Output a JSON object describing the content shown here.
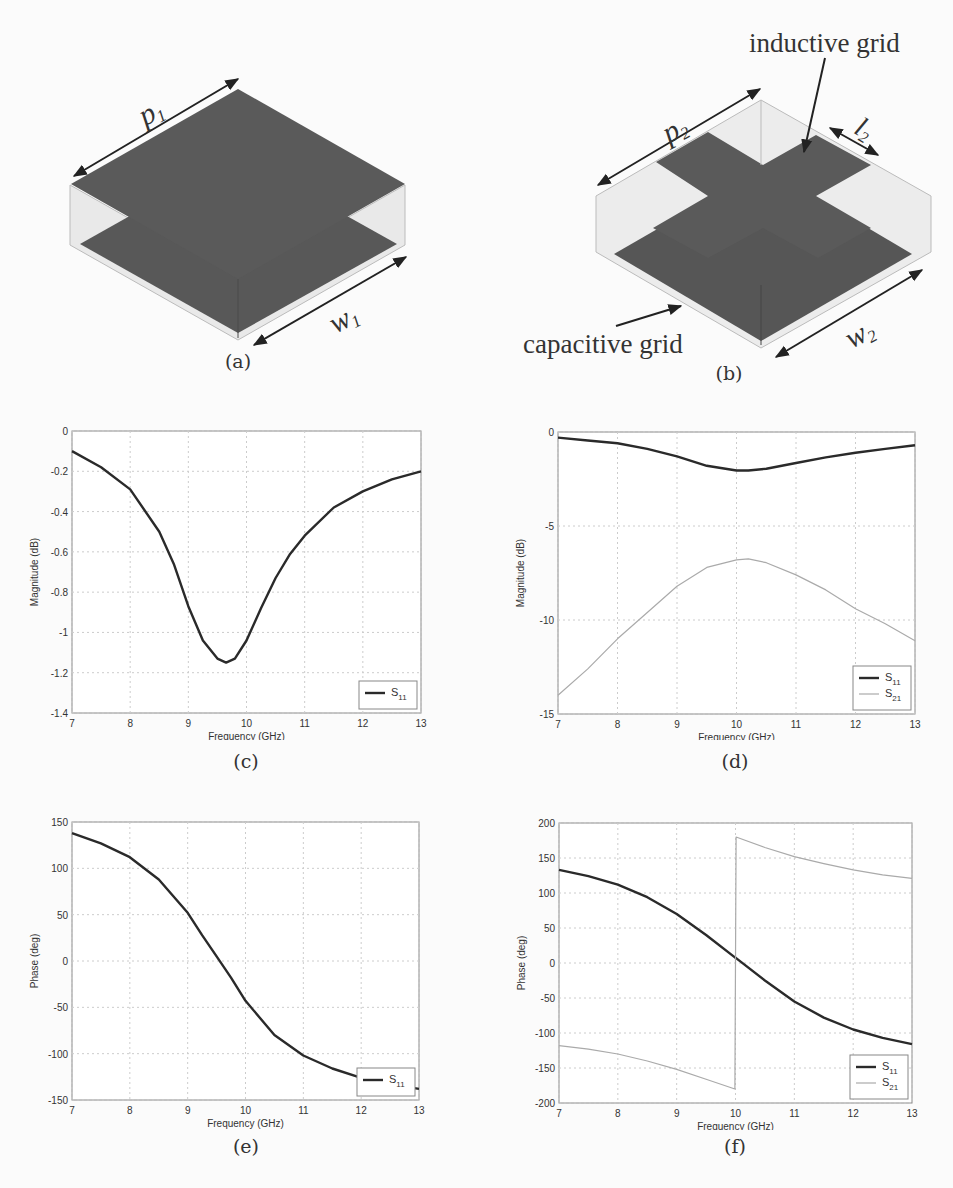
{
  "figure": {
    "panels": [
      {
        "id": "a",
        "caption": "(a)",
        "labels": {
          "p": "p",
          "p_sub": "1",
          "w": "w",
          "w_sub": "1"
        }
      },
      {
        "id": "b",
        "caption": "(b)",
        "labels": {
          "p": "p",
          "p_sub": "2",
          "w": "w",
          "w_sub": "2",
          "l": "l",
          "l_sub": "2",
          "inductive": "inductive grid",
          "capacitive": "capacitive grid"
        }
      },
      {
        "id": "c",
        "caption": "(c)"
      },
      {
        "id": "d",
        "caption": "(d)"
      },
      {
        "id": "e",
        "caption": "(e)"
      },
      {
        "id": "f",
        "caption": "(f)"
      }
    ]
  },
  "chart_data": [
    {
      "panel": "c",
      "type": "line",
      "title": "",
      "xlabel": "Frequency (GHz)",
      "ylabel": "Magnitude (dB)",
      "xlim": [
        7,
        13
      ],
      "ylim": [
        -1.4,
        0
      ],
      "xticks": [
        "7",
        "8",
        "9",
        "10",
        "11",
        "12",
        "13"
      ],
      "yticks": [
        "0",
        "-0.2",
        "-0.4",
        "-0.6",
        "-0.8",
        "-1",
        "-1.2",
        "-1.4"
      ],
      "grid": true,
      "legend_position": "lower right",
      "x": [
        7,
        7.5,
        8,
        8.5,
        8.75,
        9,
        9.25,
        9.5,
        9.65,
        9.8,
        10,
        10.25,
        10.5,
        10.75,
        11,
        11.5,
        12,
        12.5,
        13
      ],
      "series": [
        {
          "name": "S11",
          "sub": "11",
          "style": "thick-dark",
          "values": [
            -0.1,
            -0.18,
            -0.29,
            -0.5,
            -0.66,
            -0.87,
            -1.04,
            -1.13,
            -1.15,
            -1.13,
            -1.04,
            -0.88,
            -0.73,
            -0.61,
            -0.52,
            -0.38,
            -0.3,
            -0.24,
            -0.2
          ]
        }
      ]
    },
    {
      "panel": "d",
      "type": "line",
      "title": "",
      "xlabel": "Frequency (GHz)",
      "ylabel": "Magnitude (dB)",
      "xlim": [
        7,
        13
      ],
      "ylim": [
        -15,
        0
      ],
      "xticks": [
        "7",
        "8",
        "9",
        "10",
        "11",
        "12",
        "13"
      ],
      "yticks": [
        "0",
        "-5",
        "-10",
        "-15"
      ],
      "grid": true,
      "legend_position": "lower right",
      "x": [
        7,
        7.5,
        8,
        8.5,
        9,
        9.5,
        10,
        10.2,
        10.5,
        11,
        11.5,
        12,
        12.5,
        13
      ],
      "series": [
        {
          "name": "S11",
          "sub": "11",
          "style": "thick-dark",
          "values": [
            -0.3,
            -0.45,
            -0.6,
            -0.9,
            -1.3,
            -1.8,
            -2.05,
            -2.05,
            -1.95,
            -1.65,
            -1.35,
            -1.1,
            -0.9,
            -0.7
          ]
        },
        {
          "name": "S21",
          "sub": "21",
          "style": "thin-light",
          "values": [
            -14.0,
            -12.6,
            -11.0,
            -9.6,
            -8.2,
            -7.2,
            -6.8,
            -6.75,
            -6.95,
            -7.6,
            -8.4,
            -9.4,
            -10.2,
            -11.1
          ]
        }
      ]
    },
    {
      "panel": "e",
      "type": "line",
      "title": "",
      "xlabel": "Frequency (GHz)",
      "ylabel": "Phase (deg)",
      "xlim": [
        7,
        13
      ],
      "ylim": [
        -150,
        150
      ],
      "xticks": [
        "7",
        "8",
        "9",
        "10",
        "11",
        "12",
        "13"
      ],
      "yticks": [
        "150",
        "100",
        "50",
        "0",
        "-50",
        "-100",
        "-150"
      ],
      "grid": true,
      "legend_position": "lower right",
      "x": [
        7,
        7.5,
        8,
        8.5,
        9,
        9.25,
        9.5,
        9.75,
        10,
        10.5,
        11,
        11.5,
        12,
        12.5,
        13
      ],
      "series": [
        {
          "name": "S11",
          "sub": "11",
          "style": "thick-dark",
          "values": [
            138,
            127,
            112,
            88,
            52,
            28,
            5,
            -18,
            -43,
            -80,
            -102,
            -116,
            -126,
            -133,
            -138
          ]
        }
      ]
    },
    {
      "panel": "f",
      "type": "line",
      "title": "",
      "xlabel": "Frequency (GHz)",
      "ylabel": "Phase (deg)",
      "xlim": [
        7,
        13
      ],
      "ylim": [
        -200,
        200
      ],
      "xticks": [
        "7",
        "8",
        "9",
        "10",
        "11",
        "12",
        "13"
      ],
      "yticks": [
        "200",
        "150",
        "100",
        "50",
        "0",
        "-50",
        "-100",
        "-150",
        "-200"
      ],
      "grid": true,
      "legend_position": "lower right",
      "x": [
        7,
        7.5,
        8,
        8.5,
        9,
        9.5,
        9.99,
        10.01,
        10.5,
        11,
        11.5,
        12,
        12.5,
        13
      ],
      "series": [
        {
          "name": "S11",
          "sub": "11",
          "style": "thick-dark",
          "values": [
            133,
            124,
            112,
            94,
            70,
            40,
            8,
            7,
            -25,
            -55,
            -78,
            -95,
            -107,
            -116
          ]
        },
        {
          "name": "S21",
          "sub": "21",
          "style": "thin-light",
          "values": [
            -118,
            -123,
            -130,
            -140,
            -152,
            -166,
            -180,
            180,
            165,
            152,
            142,
            133,
            126,
            121
          ]
        }
      ]
    }
  ]
}
